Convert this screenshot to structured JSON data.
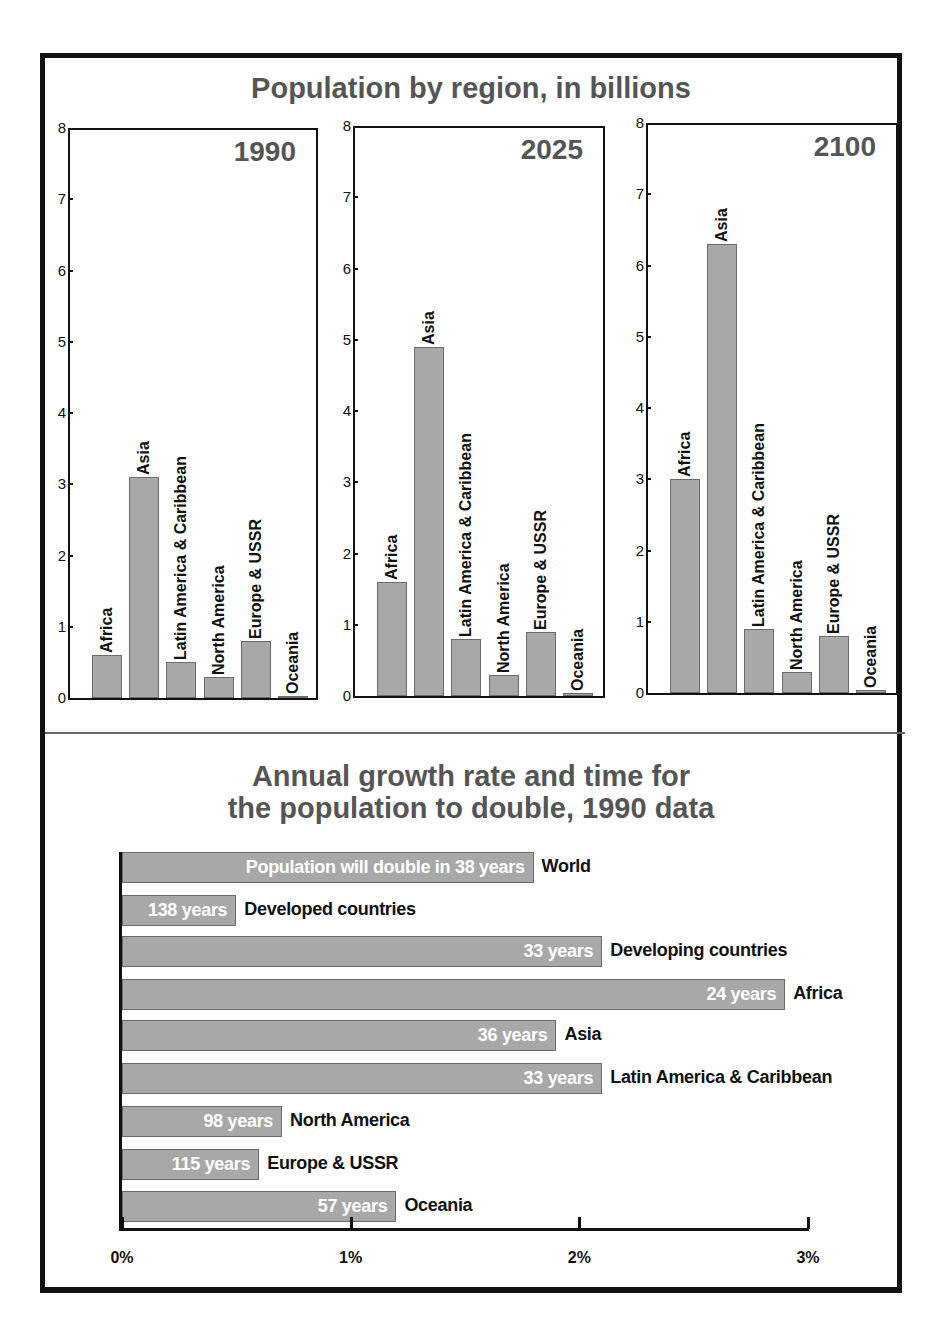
{
  "colors": {
    "bar_fill": "#a8a8a8",
    "bar_border": "#6b6b6b",
    "title": "#555555",
    "frame": "#111111"
  },
  "top_section": {
    "title": "Population by region, in billions"
  },
  "bottom_section": {
    "title_line1": "Annual growth rate and time for",
    "title_line2": "the population to double, 1990 data"
  },
  "chart_data": [
    {
      "type": "bar",
      "title": "Population by region, in billions — 1990",
      "panel_label": "1990",
      "categories": [
        "Africa",
        "Asia",
        "Latin America & Caribbean",
        "North America",
        "Europe & USSR",
        "Oceania"
      ],
      "values": [
        0.6,
        3.1,
        0.5,
        0.3,
        0.8,
        0.03
      ],
      "ylabel": "billions",
      "ylim": [
        0,
        8
      ],
      "yticks": [
        "0",
        "1",
        "2",
        "3",
        "4",
        "5",
        "6",
        "7",
        "8"
      ]
    },
    {
      "type": "bar",
      "title": "Population by region, in billions — 2025",
      "panel_label": "2025",
      "categories": [
        "Africa",
        "Asia",
        "Latin America & Caribbean",
        "North America",
        "Europe & USSR",
        "Oceania"
      ],
      "values": [
        1.6,
        4.9,
        0.8,
        0.3,
        0.9,
        0.04
      ],
      "ylabel": "billions",
      "ylim": [
        0,
        8
      ],
      "yticks": [
        "0",
        "1",
        "2",
        "3",
        "4",
        "5",
        "6",
        "7",
        "8"
      ]
    },
    {
      "type": "bar",
      "title": "Population by region, in billions — 2100",
      "panel_label": "2100",
      "categories": [
        "Africa",
        "Asia",
        "Latin America & Caribbean",
        "North America",
        "Europe & USSR",
        "Oceania"
      ],
      "values": [
        3.0,
        6.3,
        0.9,
        0.3,
        0.8,
        0.04
      ],
      "ylabel": "billions",
      "ylim": [
        0,
        8
      ],
      "yticks": [
        "0",
        "1",
        "2",
        "3",
        "4",
        "5",
        "6",
        "7",
        "8"
      ]
    },
    {
      "type": "bar",
      "orientation": "horizontal",
      "title": "Annual growth rate and time for the population to double, 1990 data",
      "categories": [
        "World",
        "Developed countries",
        "Developing countries",
        "Africa",
        "Asia",
        "Latin America & Caribbean",
        "North America",
        "Europe & USSR",
        "Oceania"
      ],
      "values": [
        1.8,
        0.5,
        2.1,
        2.9,
        1.9,
        2.1,
        0.7,
        0.6,
        1.2
      ],
      "bar_labels": [
        "Population will double in 38 years",
        "138 years",
        "33 years",
        "24 years",
        "36 years",
        "33 years",
        "98 years",
        "115 years",
        "57 years"
      ],
      "doubling_years": [
        38,
        138,
        33,
        24,
        36,
        33,
        98,
        115,
        57
      ],
      "xlabel": "annual growth rate (%)",
      "xlim": [
        0,
        3
      ],
      "xticks": [
        "0%",
        "1%",
        "2%",
        "3%"
      ]
    }
  ]
}
